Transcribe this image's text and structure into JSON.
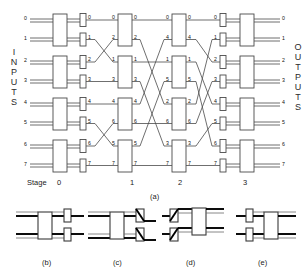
{
  "figure": {
    "title_caption": "(a)",
    "inputs_label": "INPUTS",
    "outputs_label": "OUTPUTS",
    "stage_word": "Stage",
    "stage_labels": [
      "0",
      "1",
      "2",
      "3"
    ],
    "sub_captions": [
      "(b)",
      "(c)",
      "(d)",
      "(e)"
    ],
    "line_color": "#3a3a3a",
    "box_fill": "#ffffff",
    "bold_line_color": "#000000",
    "background": "#ffffff"
  },
  "network": {
    "type": "multistage-interconnection-network",
    "num_inputs": 8,
    "num_outputs": 8,
    "num_stages": 4,
    "input_port_labels": [
      "0",
      "1",
      "2",
      "3",
      "4",
      "5",
      "6",
      "7"
    ],
    "output_port_labels": [
      "0",
      "1",
      "2",
      "3",
      "4",
      "5",
      "6",
      "7"
    ],
    "stage0_out_labels": [
      "0",
      "1",
      "2",
      "3",
      "4",
      "5",
      "6",
      "7"
    ],
    "stage1_in_labels": [
      "0",
      "2",
      "1",
      "3",
      "4",
      "6",
      "5",
      "7"
    ],
    "stage1_out_labels": [
      "0",
      "2",
      "1",
      "3",
      "4",
      "6",
      "5",
      "7"
    ],
    "stage2_in_labels": [
      "0",
      "4",
      "1",
      "5",
      "2",
      "6",
      "3",
      "7"
    ],
    "stage2_out_labels": [
      "0",
      "4",
      "1",
      "5",
      "2",
      "6",
      "3",
      "7"
    ],
    "stage3_in_labels": [
      "0",
      "1",
      "2",
      "3",
      "4",
      "5",
      "6",
      "7"
    ],
    "link_stage0_to_stage1": [
      [
        0,
        0
      ],
      [
        1,
        2
      ],
      [
        2,
        1
      ],
      [
        3,
        3
      ],
      [
        4,
        4
      ],
      [
        5,
        6
      ],
      [
        6,
        5
      ],
      [
        7,
        7
      ]
    ],
    "link_stage1_to_stage2": [
      [
        0,
        0
      ],
      [
        1,
        4
      ],
      [
        2,
        1
      ],
      [
        3,
        5
      ],
      [
        4,
        2
      ],
      [
        5,
        6
      ],
      [
        6,
        3
      ],
      [
        7,
        7
      ]
    ],
    "link_stage2_to_stage3": [
      [
        0,
        0
      ],
      [
        1,
        2
      ],
      [
        2,
        4
      ],
      [
        3,
        6
      ],
      [
        4,
        1
      ],
      [
        5,
        3
      ],
      [
        6,
        5
      ],
      [
        7,
        7
      ]
    ]
  },
  "switch_states": {
    "b": {
      "caption": "(b)",
      "name": "straight-through"
    },
    "c": {
      "caption": "(c)",
      "name": "upper-crossed"
    },
    "d": {
      "caption": "(d)",
      "name": "lower-crossed"
    },
    "e": {
      "caption": "(e)",
      "name": "straight-through-mirror"
    }
  }
}
